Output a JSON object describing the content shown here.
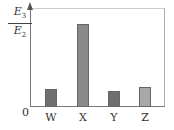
{
  "chart_data": {
    "type": "bar",
    "title": "",
    "xlabel": "",
    "ylabel": "E3/E2",
    "ylabel_numerator": "E",
    "ylabel_numerator_sub": "3",
    "ylabel_denominator": "E",
    "ylabel_denominator_sub": "2",
    "origin_label": "0",
    "categories": [
      "W",
      "X",
      "Y",
      "Z"
    ],
    "values": [
      0.22,
      1.0,
      0.19,
      0.24
    ],
    "colors": [
      "#707070",
      "#8a8a8a",
      "#6e6e6e",
      "#a8a8a8"
    ],
    "ylim": [
      0,
      1.2
    ],
    "grid": false,
    "legend": "none",
    "note": "No y-axis tick values shown; values are relative bar heights (X normalized to 1)."
  }
}
